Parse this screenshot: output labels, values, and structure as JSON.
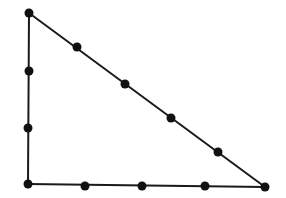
{
  "diagram": {
    "type": "right-triangle-with-points",
    "colors": {
      "background": "#ffffff",
      "line": "#1a1a1a",
      "point": "#111111"
    },
    "stroke_width": 2,
    "point_radius": 4.5,
    "vertices": [
      {
        "id": "top-left",
        "x": 29,
        "y": 13
      },
      {
        "id": "bottom-left",
        "x": 28,
        "y": 184
      },
      {
        "id": "bottom-right",
        "x": 265,
        "y": 187
      }
    ],
    "edges": [
      {
        "id": "left-side",
        "from": "top-left",
        "to": "bottom-left",
        "intermediate_points": 2
      },
      {
        "id": "bottom-side",
        "from": "bottom-left",
        "to": "bottom-right",
        "intermediate_points": 3
      },
      {
        "id": "hypotenuse",
        "from": "top-left",
        "to": "bottom-right",
        "intermediate_points": 4
      }
    ],
    "points": [
      {
        "id": "v-top-left",
        "x": 29,
        "y": 13
      },
      {
        "id": "left-1",
        "x": 29,
        "y": 71
      },
      {
        "id": "left-2",
        "x": 28,
        "y": 128
      },
      {
        "id": "v-bottom-left",
        "x": 28,
        "y": 184
      },
      {
        "id": "bottom-1",
        "x": 85,
        "y": 186
      },
      {
        "id": "bottom-2",
        "x": 142,
        "y": 186
      },
      {
        "id": "bottom-3",
        "x": 205,
        "y": 186
      },
      {
        "id": "v-bottom-right",
        "x": 265,
        "y": 187
      },
      {
        "id": "hyp-1",
        "x": 77,
        "y": 47
      },
      {
        "id": "hyp-2",
        "x": 125,
        "y": 84
      },
      {
        "id": "hyp-3",
        "x": 171,
        "y": 118
      },
      {
        "id": "hyp-4",
        "x": 218,
        "y": 152
      }
    ],
    "total_points": 12
  }
}
